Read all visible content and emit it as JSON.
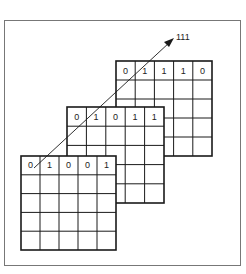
{
  "diagram": {
    "title": "",
    "arrow_label": "111",
    "grids": [
      {
        "name": "back",
        "top_row": [
          "0",
          "1",
          "1",
          "1",
          "0"
        ],
        "rows": 5,
        "cols": 5
      },
      {
        "name": "middle",
        "top_row": [
          "0",
          "1",
          "0",
          "1",
          "1"
        ],
        "rows": 5,
        "cols": 5
      },
      {
        "name": "front",
        "top_row": [
          "0",
          "1",
          "0",
          "0",
          "1"
        ],
        "rows": 5,
        "cols": 5
      }
    ]
  },
  "colors": {
    "line": "#1a1a1a",
    "frame": "#555555",
    "background": "#ffffff"
  }
}
